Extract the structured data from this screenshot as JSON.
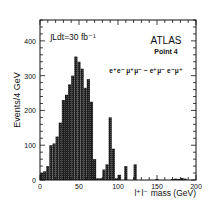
{
  "chart_data": {
    "type": "bar",
    "title": "",
    "xlabel": "l⁺l⁻ mass  (GeV)",
    "ylabel": "Events/4 GeV",
    "xlim": [
      0,
      200
    ],
    "ylim": [
      0,
      460
    ],
    "bin_width": 4,
    "x_ticks": [
      0,
      50,
      100,
      150,
      200
    ],
    "y_ticks": [
      0,
      100,
      200,
      300,
      400
    ],
    "grid": false,
    "annotations": {
      "luminosity": "∫Ldt=30 fb⁻¹",
      "experiment": "ATLAS",
      "point": "Point 4",
      "channel": "e⁺e⁻ μ⁺μ⁻ − e⁺μ⁻ e⁻μ⁺"
    },
    "bin_edges_low": [
      0,
      4,
      8,
      12,
      16,
      20,
      24,
      28,
      32,
      36,
      40,
      44,
      48,
      52,
      56,
      60,
      64,
      68,
      72,
      76,
      80,
      84,
      88,
      92,
      96,
      100,
      104,
      108,
      112,
      116,
      120,
      124,
      128,
      132,
      136,
      140,
      144,
      148,
      152,
      156,
      160,
      164,
      168,
      172,
      176,
      180,
      184,
      188,
      192,
      196
    ],
    "values": [
      20,
      25,
      40,
      100,
      105,
      125,
      165,
      230,
      245,
      275,
      300,
      355,
      340,
      320,
      265,
      290,
      225,
      60,
      5,
      5,
      30,
      45,
      180,
      90,
      5,
      15,
      0,
      40,
      0,
      0,
      45,
      0,
      0,
      0,
      0,
      0,
      0,
      3,
      0,
      0,
      0,
      0,
      3,
      4,
      3,
      6,
      4,
      0,
      0,
      0
    ],
    "fill_color": "#2a2a2a"
  },
  "axes": {
    "x_tick_labels": [
      "0",
      "50",
      "100",
      "150",
      "200"
    ],
    "y_tick_labels": [
      "0",
      "100",
      "200",
      "300",
      "400"
    ]
  }
}
